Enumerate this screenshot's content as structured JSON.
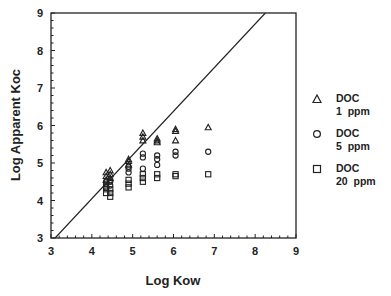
{
  "chart_data": {
    "type": "scatter",
    "title": "",
    "xlabel": "Log Kow",
    "ylabel": "Log Apparent Koc",
    "xlim": [
      3,
      9
    ],
    "ylim": [
      3,
      9
    ],
    "x_ticks": [
      "3",
      "4",
      "5",
      "6",
      "7",
      "8",
      "9"
    ],
    "y_ticks": [
      "3",
      "4",
      "5",
      "6",
      "7",
      "8",
      "9"
    ],
    "grid": false,
    "legend_position": "right",
    "reference_line": {
      "label": "1:1 regression line",
      "x": [
        3.1,
        8.25
      ],
      "y": [
        3.0,
        9.0
      ]
    },
    "series": [
      {
        "name": "DOC 1 ppm",
        "marker": "triangle",
        "points": [
          [
            4.35,
            4.55
          ],
          [
            4.35,
            4.65
          ],
          [
            4.35,
            4.75
          ],
          [
            4.45,
            4.6
          ],
          [
            4.45,
            4.7
          ],
          [
            4.45,
            4.8
          ],
          [
            4.9,
            4.95
          ],
          [
            4.9,
            5.05
          ],
          [
            4.9,
            5.1
          ],
          [
            5.25,
            5.6
          ],
          [
            5.25,
            5.7
          ],
          [
            5.25,
            5.8
          ],
          [
            5.6,
            5.55
          ],
          [
            5.6,
            5.6
          ],
          [
            5.6,
            5.65
          ],
          [
            6.05,
            5.85
          ],
          [
            6.05,
            5.9
          ],
          [
            6.05,
            5.6
          ],
          [
            6.85,
            5.95
          ]
        ]
      },
      {
        "name": "DOC 5 ppm",
        "marker": "circle",
        "points": [
          [
            4.35,
            4.35
          ],
          [
            4.35,
            4.45
          ],
          [
            4.35,
            4.5
          ],
          [
            4.45,
            4.4
          ],
          [
            4.45,
            4.5
          ],
          [
            4.45,
            4.55
          ],
          [
            4.9,
            4.75
          ],
          [
            4.9,
            4.85
          ],
          [
            4.9,
            4.9
          ],
          [
            5.25,
            5.15
          ],
          [
            5.25,
            5.25
          ],
          [
            5.25,
            4.85
          ],
          [
            5.6,
            5.1
          ],
          [
            5.6,
            5.2
          ],
          [
            5.6,
            4.95
          ],
          [
            6.05,
            5.2
          ],
          [
            6.05,
            5.3
          ],
          [
            6.85,
            5.3
          ]
        ]
      },
      {
        "name": "DOC 20 ppm",
        "marker": "square",
        "points": [
          [
            4.35,
            4.2
          ],
          [
            4.35,
            4.3
          ],
          [
            4.35,
            4.4
          ],
          [
            4.45,
            4.1
          ],
          [
            4.45,
            4.2
          ],
          [
            4.45,
            4.3
          ],
          [
            4.9,
            4.35
          ],
          [
            4.9,
            4.45
          ],
          [
            4.9,
            4.55
          ],
          [
            5.25,
            4.5
          ],
          [
            5.25,
            4.6
          ],
          [
            5.25,
            4.7
          ],
          [
            5.6,
            4.6
          ],
          [
            5.6,
            4.7
          ],
          [
            6.05,
            4.65
          ],
          [
            6.05,
            4.7
          ],
          [
            6.85,
            4.7
          ]
        ]
      }
    ]
  },
  "legend": {
    "items": [
      {
        "symbol": "triangle",
        "line1": "DOC",
        "line2": "1  ppm"
      },
      {
        "symbol": "circle",
        "line1": "DOC",
        "line2": "5  ppm"
      },
      {
        "symbol": "square",
        "line1": "DOC",
        "line2": "20  ppm"
      }
    ]
  }
}
